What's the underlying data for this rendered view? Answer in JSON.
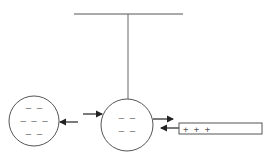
{
  "diagram": {
    "colors": {
      "stroke": "#555555",
      "arrow": "#222222",
      "background": "#ffffff"
    },
    "left_sphere": {
      "charges": [
        "– –",
        "– – –",
        "– –"
      ]
    },
    "middle_sphere": {
      "charges": [
        "– –",
        "– –"
      ]
    },
    "rod": {
      "label": "+ + +"
    }
  }
}
